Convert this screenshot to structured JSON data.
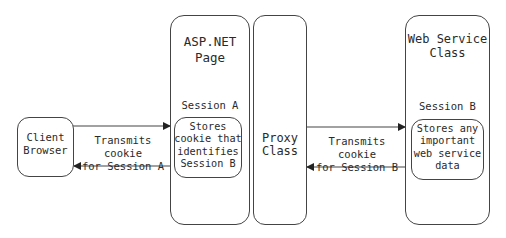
{
  "diagram": {
    "client": {
      "label": "Client\nBrowser"
    },
    "aspnet": {
      "title": "ASP.NET Page",
      "session": "Session A",
      "inner": "Stores\ncookie that\nidentifies\nSession B"
    },
    "proxy": {
      "label": "Proxy\nClass"
    },
    "webservice": {
      "title": "Web Service\nClass",
      "session": "Session B",
      "inner": "Stores any\nimportant\nweb service\ndata"
    },
    "arrow_left": {
      "label": "Transmits cookie\nfor Session A"
    },
    "arrow_right": {
      "label": "Transmits cookie\nfor Session B"
    }
  }
}
